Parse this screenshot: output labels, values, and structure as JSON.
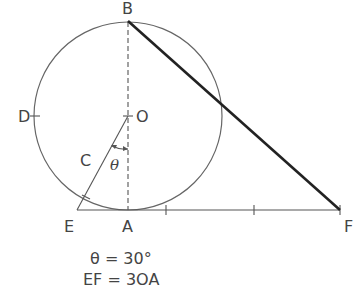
{
  "diagram": {
    "labels": {
      "B": "B",
      "O": "O",
      "D": "D",
      "C": "C",
      "E": "E",
      "A": "A",
      "F": "F",
      "theta": "θ"
    },
    "caption": {
      "line1": "θ = 30°",
      "line2": "EF = 3OA"
    },
    "colors": {
      "stroke": "#555555",
      "heavy_stroke": "#222222",
      "text": "#444444"
    }
  }
}
